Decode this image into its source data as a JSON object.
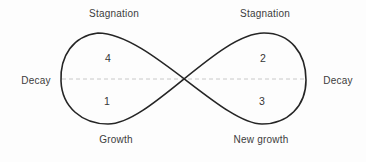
{
  "diagram": {
    "type": "infinity-loop-lifecycle",
    "labels": {
      "top_left": "Stagnation",
      "top_right": "Stagnation",
      "left": "Decay",
      "right": "Decay",
      "bottom_left": "Growth",
      "bottom_right": "New growth"
    },
    "phases": [
      {
        "number": "4",
        "position": "upper-left-loop"
      },
      {
        "number": "2",
        "position": "upper-right-loop"
      },
      {
        "number": "1",
        "position": "lower-left-loop"
      },
      {
        "number": "3",
        "position": "lower-right-loop"
      }
    ],
    "colors": {
      "background": "#fdfdfd",
      "curve": "#252525",
      "dashed_line": "#c8c8c8",
      "text": "#3c3c3c"
    }
  }
}
